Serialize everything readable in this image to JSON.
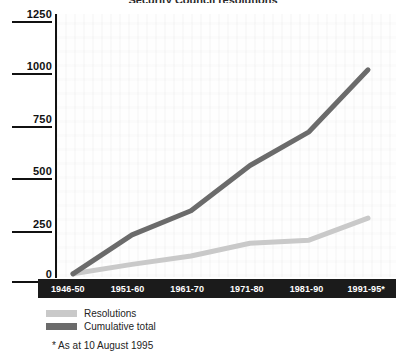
{
  "chart_data": {
    "type": "line",
    "title": "Security Council resolutions",
    "categories": [
      "1946-50",
      "1951-60",
      "1961-70",
      "1971-80",
      "1981-90",
      "1991-95*"
    ],
    "series": [
      {
        "name": "Resolutions",
        "values": [
          15,
          60,
          100,
          160,
          175,
          280
        ],
        "color": "#c9c9c9"
      },
      {
        "name": "Cumulative total",
        "values": [
          15,
          200,
          315,
          530,
          690,
          985
        ],
        "color": "#6b6b6b"
      }
    ],
    "ylim": [
      0,
      1250
    ],
    "yticks": [
      "0",
      "250",
      "500",
      "750",
      "1000",
      "1250"
    ],
    "xlabel": "",
    "ylabel": "",
    "grid": false,
    "legend_position": "below-left",
    "annotations": [
      "* As at 10 August 1995"
    ]
  },
  "legend": {
    "items": [
      {
        "label": "Resolutions"
      },
      {
        "label": "Cumulative total"
      }
    ]
  },
  "footnote": "* As at 10 August 1995"
}
